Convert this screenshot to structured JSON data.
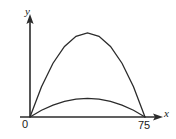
{
  "figure": {
    "kind": "line-plot",
    "background_color": "#ffffff",
    "stroke_color": "#2b2b2b",
    "axes": {
      "x_axis_label": "x",
      "y_axis_label": "y",
      "origin_label": "0",
      "x_end_tick_label": "75",
      "x_axis_name": "x-axis",
      "y_axis_name": "y-axis"
    }
  },
  "chart_data": {
    "type": "line",
    "title": "",
    "subtitle": "",
    "xlabel": "x",
    "ylabel": "y",
    "xlim": [
      0,
      90
    ],
    "ylim": [
      0,
      30
    ],
    "grid": false,
    "legend": "none",
    "annotations": [],
    "xticks": [
      0,
      75
    ],
    "xticklabels": [
      "0",
      "75"
    ],
    "yticks": [],
    "yticklabels": [],
    "series": [
      {
        "name": "upper-trajectory",
        "shape": "parabola",
        "x": [
          0,
          7.5,
          15,
          22.5,
          30,
          37.5,
          45,
          52.5,
          60,
          67.5,
          75
        ],
        "values": [
          0,
          8.1,
          14.4,
          18.9,
          21.6,
          22.5,
          21.6,
          18.9,
          14.4,
          8.1,
          0
        ],
        "peak_x": 37.5,
        "peak_y": 22.5
      },
      {
        "name": "lower-trajectory",
        "shape": "parabola",
        "x": [
          0,
          7.5,
          15,
          22.5,
          30,
          37.5,
          45,
          52.5,
          60,
          67.5,
          75
        ],
        "values": [
          0,
          1.8,
          3.2,
          4.2,
          4.8,
          5.0,
          4.8,
          4.2,
          3.2,
          1.8,
          0
        ],
        "peak_x": 37.5,
        "peak_y": 5.0
      }
    ]
  }
}
